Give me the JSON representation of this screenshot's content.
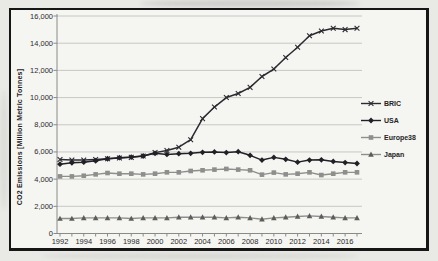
{
  "figure": {
    "frame": "scanned grayscale line chart in black frame"
  },
  "chart_data": {
    "type": "line",
    "title": "",
    "xlabel": "",
    "ylabel": "CO2 Emissions [Million Metric Tonnes]",
    "ylim": [
      0,
      16000
    ],
    "grid": "horizontal",
    "legend_position": "right",
    "x": [
      1992,
      1993,
      1994,
      1995,
      1996,
      1997,
      1998,
      1999,
      2000,
      2001,
      2002,
      2003,
      2004,
      2005,
      2006,
      2007,
      2008,
      2009,
      2010,
      2011,
      2012,
      2013,
      2014,
      2015,
      2016,
      2017
    ],
    "x_tick_labels": [
      "1992",
      "1994",
      "1996",
      "1998",
      "2000",
      "2002",
      "2004",
      "2006",
      "2008",
      "2010",
      "2012",
      "2014",
      "2016"
    ],
    "y_ticks": [
      0,
      2000,
      4000,
      6000,
      8000,
      10000,
      12000,
      14000,
      16000
    ],
    "y_tick_labels": [
      "0",
      "2,000",
      "4,000",
      "6,000",
      "8,000",
      "10,000",
      "12,000",
      "14,000",
      "16,000"
    ],
    "series": [
      {
        "name": "BRIC",
        "marker": "x",
        "color": "#2a2a31",
        "values": [
          5450,
          5400,
          5400,
          5450,
          5500,
          5550,
          5600,
          5700,
          5950,
          6100,
          6350,
          6900,
          8450,
          9300,
          10000,
          10300,
          10750,
          11550,
          12100,
          12950,
          13700,
          14550,
          14900,
          15100,
          15000,
          15100
        ]
      },
      {
        "name": "USA",
        "marker": "diamond",
        "color": "#202026",
        "values": [
          5100,
          5200,
          5250,
          5350,
          5500,
          5580,
          5620,
          5700,
          5900,
          5820,
          5870,
          5900,
          5970,
          6000,
          5950,
          6020,
          5750,
          5400,
          5600,
          5460,
          5250,
          5400,
          5420,
          5300,
          5220,
          5150
        ]
      },
      {
        "name": "Europe38",
        "marker": "square",
        "color": "#8e8e8c",
        "values": [
          4200,
          4200,
          4250,
          4350,
          4450,
          4400,
          4400,
          4350,
          4400,
          4500,
          4500,
          4600,
          4650,
          4700,
          4750,
          4700,
          4650,
          4330,
          4480,
          4350,
          4400,
          4500,
          4300,
          4400,
          4500,
          4500
        ]
      },
      {
        "name": "Japan",
        "marker": "triangle",
        "color": "#8e8e8c",
        "marker_color": "#5c5c5a",
        "values": [
          1100,
          1100,
          1150,
          1150,
          1150,
          1150,
          1100,
          1150,
          1150,
          1150,
          1200,
          1200,
          1200,
          1200,
          1150,
          1200,
          1150,
          1050,
          1150,
          1200,
          1250,
          1300,
          1250,
          1200,
          1150,
          1150
        ]
      }
    ],
    "style": {
      "grid_color": "#c2c2bf",
      "axis_color": "#8a8a88",
      "plot_bg": "#f5f5f2"
    }
  }
}
